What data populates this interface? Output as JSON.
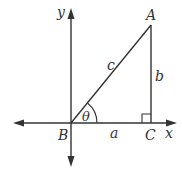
{
  "diagram": {
    "type": "right-triangle-on-axes",
    "axes": {
      "x_label": "x",
      "y_label": "y"
    },
    "vertices": {
      "A": "A",
      "B": "B",
      "C": "C"
    },
    "sides": {
      "hypotenuse": "c",
      "vertical": "b",
      "horizontal": "a"
    },
    "angle": "θ",
    "colors": {
      "line": "#333333",
      "background": "#ffffff"
    }
  }
}
